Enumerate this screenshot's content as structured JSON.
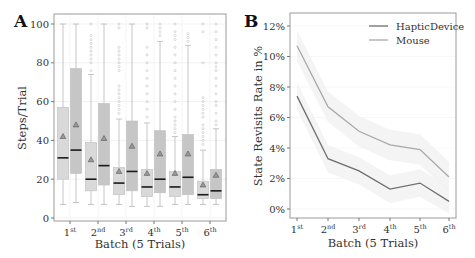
{
  "panels": {
    "a": {
      "letter": "A"
    },
    "b": {
      "letter": "B"
    }
  },
  "chart_data": [
    {
      "type": "box",
      "panel": "A",
      "title": "",
      "xlabel": "Batch (5 Trials)",
      "ylabel": "Steps/Trial",
      "ylim": [
        0,
        100
      ],
      "yticks": [
        0,
        20,
        40,
        60,
        80,
        100
      ],
      "categories": [
        "1st",
        "2nd",
        "3rd",
        "4th",
        "5th",
        "6th"
      ],
      "category_labels": [
        {
          "num": "1",
          "sup": "st"
        },
        {
          "num": "2",
          "sup": "nd"
        },
        {
          "num": "3",
          "sup": "rd"
        },
        {
          "num": "4",
          "sup": "th"
        },
        {
          "num": "5",
          "sup": "th"
        },
        {
          "num": "6",
          "sup": "th"
        }
      ],
      "series": [
        {
          "name": "HapticDevice",
          "color": "#d9d9d9",
          "boxes": [
            {
              "whislo": 7,
              "q1": 20,
              "med": 31,
              "q3": 57,
              "whishi": 100,
              "mean": 42
            },
            {
              "whislo": 7,
              "q1": 14,
              "med": 20,
              "q3": 39,
              "whishi": 74,
              "mean": 30
            },
            {
              "whislo": 7,
              "q1": 12,
              "med": 18,
              "q3": 26,
              "whishi": 51,
              "mean": 24
            },
            {
              "whislo": 6,
              "q1": 11,
              "med": 16,
              "q3": 25,
              "whishi": 49,
              "mean": 23
            },
            {
              "whislo": 7,
              "q1": 11,
              "med": 16,
              "q3": 24,
              "whishi": 42,
              "mean": 23
            },
            {
              "whislo": 7,
              "q1": 10,
              "med": 12,
              "q3": 19,
              "whishi": 35,
              "mean": 17
            }
          ],
          "fliers": [
            [],
            [
              76,
              80,
              82,
              84,
              86,
              88,
              90,
              92,
              94,
              100
            ],
            [
              54,
              56,
              58,
              60,
              62,
              64,
              66,
              68,
              76,
              78,
              80,
              82,
              84,
              86,
              88,
              98,
              100
            ],
            [
              52,
              56,
              60,
              64,
              68,
              72,
              76,
              80,
              84,
              88,
              98,
              100
            ],
            [
              44,
              46,
              48,
              50,
              52,
              56,
              60,
              64,
              68,
              72,
              76,
              80,
              84,
              88,
              92,
              94,
              96,
              100
            ],
            [
              38,
              40,
              42,
              44,
              46,
              48,
              52,
              54,
              56,
              58,
              60,
              62,
              80,
              96,
              100
            ]
          ]
        },
        {
          "name": "Mouse",
          "color": "#c6c6c6",
          "boxes": [
            {
              "whislo": 8,
              "q1": 23,
              "med": 35,
              "q3": 77,
              "whishi": 100,
              "mean": 48
            },
            {
              "whislo": 7,
              "q1": 17,
              "med": 27,
              "q3": 59,
              "whishi": 100,
              "mean": 41
            },
            {
              "whislo": 6,
              "q1": 14,
              "med": 24,
              "q3": 50,
              "whishi": 100,
              "mean": 37
            },
            {
              "whislo": 6,
              "q1": 13,
              "med": 20,
              "q3": 45,
              "whishi": 91,
              "mean": 33
            },
            {
              "whislo": 7,
              "q1": 12,
              "med": 21,
              "q3": 43,
              "whishi": 89,
              "mean": 33
            },
            {
              "whislo": 7,
              "q1": 10,
              "med": 14,
              "q3": 25,
              "whishi": 46,
              "mean": 22
            }
          ],
          "fliers": [
            [],
            [],
            [],
            [
              94,
              96,
              98,
              100
            ],
            [
              91,
              93,
              95
            ],
            [
              48,
              50,
              54,
              58,
              60,
              64,
              68,
              72,
              76,
              78,
              80,
              84,
              88,
              92,
              96,
              100
            ]
          ]
        }
      ]
    },
    {
      "type": "line",
      "panel": "B",
      "title": "",
      "xlabel": "Batch (5 Trials)",
      "ylabel": "State Revisits Rate in %",
      "ylim": [
        -0.5,
        12.8
      ],
      "yticks": [
        0,
        2,
        4,
        6,
        8,
        10,
        12
      ],
      "ytick_labels": [
        "0%",
        "2%",
        "4%",
        "6%",
        "8%",
        "10%",
        "12%"
      ],
      "x": [
        "1st",
        "2nd",
        "3rd",
        "4th",
        "5th",
        "6th"
      ],
      "legend_position": "upper right",
      "series": [
        {
          "name": "HapticDevice",
          "color": "#6f6f6f",
          "values": [
            7.4,
            3.3,
            2.5,
            1.3,
            1.7,
            0.5
          ]
        },
        {
          "name": "Mouse",
          "color": "#a9a9a9",
          "values": [
            10.7,
            6.7,
            5.1,
            4.2,
            3.9,
            2.1
          ]
        }
      ]
    }
  ]
}
